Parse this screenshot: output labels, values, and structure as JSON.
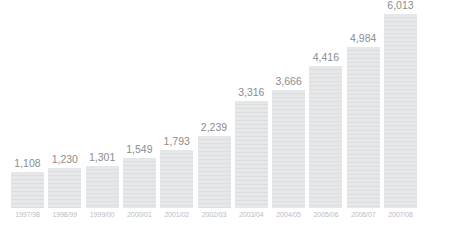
{
  "chart_data": {
    "type": "bar",
    "title": "",
    "xlabel": "",
    "ylabel": "",
    "ylim": [
      0,
      6013
    ],
    "grid": false,
    "legend": null,
    "categories": [
      "1997/98",
      "1998/99",
      "1999/00",
      "2000/01",
      "2001/02",
      "2002/03",
      "2003/04",
      "2004/05",
      "2005/06",
      "2006/07",
      "2007/08"
    ],
    "values": [
      1108,
      1230,
      1301,
      1549,
      1793,
      2239,
      3316,
      3666,
      4416,
      4984,
      6013
    ],
    "value_labels": [
      "1,108",
      "1,230",
      "1,301",
      "1,549",
      "1,793",
      "2,239",
      "3,316",
      "3,666",
      "4,416",
      "4,984",
      "6,013"
    ],
    "bar_color": "#e3e4e5",
    "value_label_color": "#8b8c8e",
    "category_label_color": "#bcbdbf",
    "background_color": "#ffffff"
  },
  "bars": [
    {
      "label": "1997/98",
      "value": 1108,
      "value_label": "1,108"
    },
    {
      "label": "1998/99",
      "value": 1230,
      "value_label": "1,230"
    },
    {
      "label": "1999/00",
      "value": 1301,
      "value_label": "1,301"
    },
    {
      "label": "2000/01",
      "value": 1549,
      "value_label": "1,549"
    },
    {
      "label": "2001/02",
      "value": 1793,
      "value_label": "1,793"
    },
    {
      "label": "2002/03",
      "value": 2239,
      "value_label": "2,239"
    },
    {
      "label": "2003/04",
      "value": 3316,
      "value_label": "3,316"
    },
    {
      "label": "2004/05",
      "value": 3666,
      "value_label": "3,666"
    },
    {
      "label": "2005/06",
      "value": 4416,
      "value_label": "4,416"
    },
    {
      "label": "2006/07",
      "value": 4984,
      "value_label": "4,984"
    },
    {
      "label": "2007/08",
      "value": 6013,
      "value_label": "6,013"
    }
  ],
  "title_remnant": ""
}
